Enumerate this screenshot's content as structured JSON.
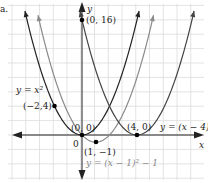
{
  "figure": {
    "part_label": "a.",
    "axes": {
      "x_label": "x",
      "y_label": "y",
      "origin_label": "0"
    },
    "curves": [
      {
        "name": "parent",
        "equation": "y = x²",
        "color": "#222222"
      },
      {
        "name": "shifted-right-down",
        "equation": "y = (x − 1)² − 1",
        "color": "#8a8a8a"
      },
      {
        "name": "shifted-right-4",
        "equation": "y = (x − 4)²",
        "color": "#555555"
      }
    ],
    "points": [
      {
        "label": "(0, 16)",
        "x": 0,
        "y": 16
      },
      {
        "label": "(−2,4)",
        "x": -2,
        "y": 4
      },
      {
        "label": "(0, 0)",
        "x": 0,
        "y": 0
      },
      {
        "label": "(1, −1)",
        "x": 1,
        "y": -1
      },
      {
        "label": "(4, 0)",
        "x": 4,
        "y": 0
      }
    ],
    "colors": {
      "grid": "#d9d9d9",
      "axis": "#222222",
      "dark_curve": "#222222",
      "gray_curve": "#8a8a8a"
    }
  },
  "chart_data": {
    "type": "line",
    "title": "",
    "xlabel": "x",
    "ylabel": "y",
    "xlim": [
      -6,
      9
    ],
    "ylim": [
      -7,
      17
    ],
    "grid": true,
    "series": [
      {
        "name": "y = x^2",
        "points": [
          [
            -4,
            16
          ],
          [
            -2,
            4
          ],
          [
            0,
            0
          ],
          [
            2,
            4
          ],
          [
            4,
            16
          ]
        ]
      },
      {
        "name": "y = (x-1)^2 - 1",
        "points": [
          [
            -3,
            15
          ],
          [
            -1,
            3
          ],
          [
            0,
            0
          ],
          [
            1,
            -1
          ],
          [
            2,
            0
          ],
          [
            3,
            3
          ],
          [
            5,
            15
          ]
        ]
      },
      {
        "name": "y = (x-4)^2",
        "points": [
          [
            0,
            16
          ],
          [
            2,
            4
          ],
          [
            4,
            0
          ],
          [
            6,
            4
          ],
          [
            8,
            16
          ]
        ]
      }
    ],
    "annotations": [
      "(0, 16)",
      "(−2,4)",
      "(0, 0)",
      "(1, −1)",
      "(4, 0)",
      "y = x²",
      "y = (x − 1)² − 1",
      "y = (x − 4)²"
    ]
  }
}
